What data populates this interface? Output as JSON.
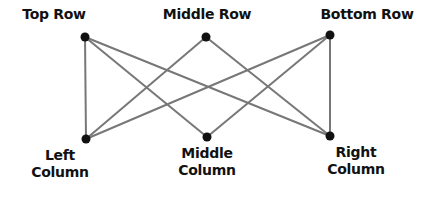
{
  "diagram": {
    "type": "bipartite-graph",
    "colors": {
      "node": "#111111",
      "edge": "#777777",
      "text": "#111111",
      "background": "#ffffff"
    },
    "nodes": [
      {
        "id": "top_row",
        "label": "Top Row",
        "x": 85,
        "y": 37,
        "label_x": 54,
        "label_y": 6
      },
      {
        "id": "middle_row",
        "label": "Middle Row",
        "x": 206,
        "y": 37,
        "label_x": 207,
        "label_y": 6
      },
      {
        "id": "bottom_row",
        "label": "Bottom Row",
        "x": 330,
        "y": 35,
        "label_x": 367,
        "label_y": 6
      },
      {
        "id": "left_column",
        "label": "Left Column",
        "line1": "Left",
        "line2": "Column",
        "x": 86,
        "y": 139,
        "label_x": 60,
        "label_y": 147
      },
      {
        "id": "middle_column",
        "label": "Middle Column",
        "line1": "Middle",
        "line2": "Column",
        "x": 207,
        "y": 137,
        "label_x": 207,
        "label_y": 145
      },
      {
        "id": "right_column",
        "label": "Right Column",
        "line1": "Right",
        "line2": "Column",
        "x": 330,
        "y": 136,
        "label_x": 356,
        "label_y": 144
      }
    ],
    "edges": [
      [
        "top_row",
        "left_column"
      ],
      [
        "top_row",
        "middle_column"
      ],
      [
        "top_row",
        "right_column"
      ],
      [
        "middle_row",
        "left_column"
      ],
      [
        "middle_row",
        "right_column"
      ],
      [
        "bottom_row",
        "left_column"
      ],
      [
        "bottom_row",
        "middle_column"
      ],
      [
        "bottom_row",
        "right_column"
      ]
    ]
  },
  "labels": {
    "top_row": "Top Row",
    "middle_row": "Middle Row",
    "bottom_row": "Bottom Row",
    "left_column_1": "Left",
    "left_column_2": "Column",
    "middle_column_1": "Middle",
    "middle_column_2": "Column",
    "right_column_1": "Right",
    "right_column_2": "Column"
  }
}
